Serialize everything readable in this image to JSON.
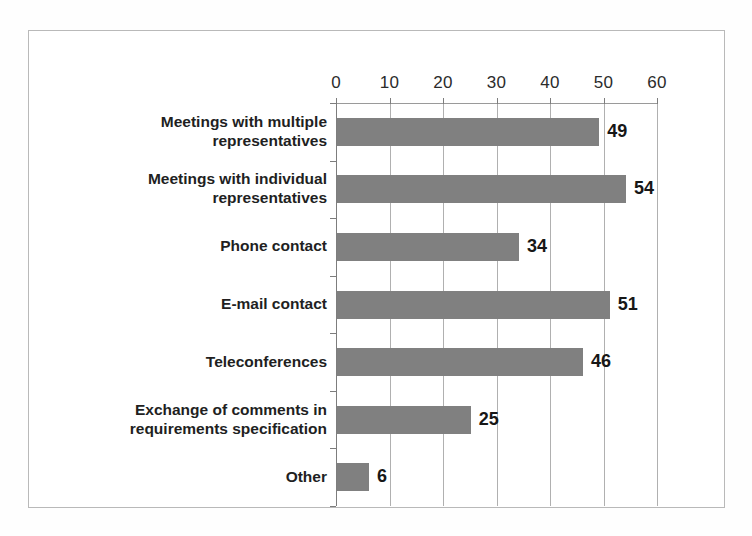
{
  "chart_data": {
    "type": "bar",
    "orientation": "horizontal",
    "title": "",
    "subtitle": "",
    "xlabel": "",
    "ylabel": "",
    "xlim": [
      0,
      60
    ],
    "xticks": [
      0,
      10,
      20,
      30,
      40,
      50,
      60
    ],
    "xtick_labels": [
      "0",
      "10",
      "20",
      "30",
      "40",
      "50",
      "60"
    ],
    "grid": true,
    "grid_axis": "x",
    "legend": false,
    "legend_position": "none",
    "bar_color": "#808080",
    "value_label_color": "#171717",
    "category_label_color": "#221f1f",
    "frame_color": "#b9b9b9",
    "gridline_color": "#b0b0b0",
    "axis_color": "#7d7d7d",
    "categories": [
      "Meetings with multiple representatives",
      "Meetings with individual representatives",
      "Phone contact",
      "E-mail contact",
      "Teleconferences",
      "Exchange of comments in requirements specification",
      "Other"
    ],
    "category_lines": [
      [
        "Meetings with multiple",
        "representatives"
      ],
      [
        "Meetings with individual",
        "representatives"
      ],
      [
        "Phone contact"
      ],
      [
        "E-mail contact"
      ],
      [
        "Teleconferences"
      ],
      [
        "Exchange of comments in",
        "requirements specification"
      ],
      [
        "Other"
      ]
    ],
    "values": [
      49,
      54,
      34,
      51,
      46,
      25,
      6
    ],
    "value_labels": [
      "49",
      "54",
      "34",
      "51",
      "46",
      "25",
      "6"
    ],
    "series": [
      {
        "name": "Responses",
        "values": [
          49,
          54,
          34,
          51,
          46,
          25,
          6
        ]
      }
    ]
  }
}
